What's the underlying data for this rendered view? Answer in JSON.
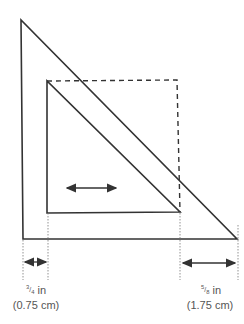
{
  "diagram": {
    "outer_triangle": {
      "points": [
        [
          21,
          20
        ],
        [
          23,
          239
        ],
        [
          237,
          239
        ]
      ],
      "stroke": "#333333"
    },
    "inner_triangle": {
      "points": [
        [
          47,
          81
        ],
        [
          47,
          213
        ],
        [
          180,
          212
        ]
      ],
      "stroke": "#333333"
    },
    "dashed_rectangle": {
      "top_left": [
        47,
        81
      ],
      "top_right": [
        177,
        80
      ],
      "bottom_right": [
        180,
        212
      ]
    },
    "move_arrow": {
      "from": [
        65,
        188
      ],
      "to": [
        118,
        188
      ]
    },
    "left_gap": {
      "fraction_num": "3",
      "fraction_den": "4",
      "unit": "in",
      "metric": "(0.75 cm)"
    },
    "right_gap": {
      "fraction_num": "5",
      "fraction_den": "8",
      "unit": "in",
      "metric": "(1.75 cm)"
    }
  }
}
